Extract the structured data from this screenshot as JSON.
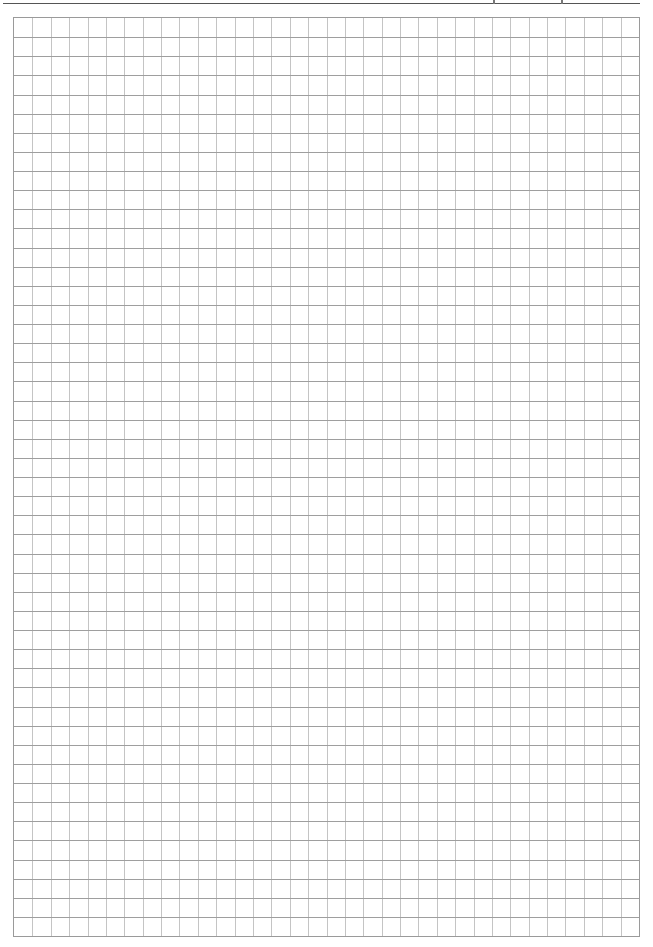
{
  "page": {
    "type": "graph-paper",
    "header": {
      "text_visible": false
    },
    "grid": {
      "columns": 34,
      "rows": 48,
      "cell_width_px": 18.44,
      "cell_height_px": 19.17,
      "horizontal_line_color": "#9e9e9e",
      "vertical_line_color": "#c4c4c4",
      "border_color": "#9a9a9a",
      "background": "#ffffff"
    }
  }
}
